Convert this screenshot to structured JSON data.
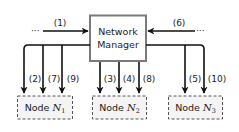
{
  "diagram": {
    "manager": {
      "line1": "Network",
      "line2": "Manager",
      "border_color": "#7a7a7a"
    },
    "incoming": [
      {
        "id": "1",
        "label": "(1)",
        "side": "left",
        "dots": "···"
      },
      {
        "id": "6",
        "label": "(6)",
        "side": "right",
        "dots": "···"
      }
    ],
    "nodes": [
      {
        "id": "N1",
        "prefix": "Node ",
        "symbol": "N",
        "subscript": "1",
        "edges": [
          "(2)",
          "(7)",
          "(9)"
        ]
      },
      {
        "id": "N2",
        "prefix": "Node ",
        "symbol": "N",
        "subscript": "2",
        "edges": [
          "(3)",
          "(4)",
          "(8)"
        ]
      },
      {
        "id": "N3",
        "prefix": "Node ",
        "symbol": "N",
        "subscript": "3",
        "edges": [
          "(5)",
          "(10)"
        ]
      }
    ],
    "colors": {
      "line": "#111111",
      "node_border": "#555555",
      "node_fill": "#f4f4f4"
    }
  }
}
